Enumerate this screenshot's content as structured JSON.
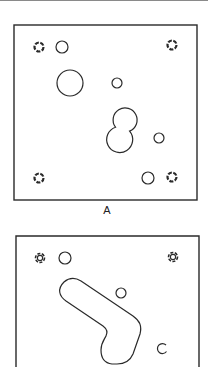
{
  "figure": {
    "stroke_color": "#2a2a2a",
    "background": "#ffffff",
    "panels": [
      {
        "id": "A",
        "label": "A",
        "frame": {
          "x": 14,
          "y": 25,
          "w": 183,
          "h": 175
        },
        "fiducials": [
          {
            "cx": 39,
            "cy": 47
          },
          {
            "cx": 172,
            "cy": 45
          },
          {
            "cx": 39,
            "cy": 178
          },
          {
            "cx": 172,
            "cy": 177
          }
        ],
        "holes": [
          {
            "cx": 62,
            "cy": 47,
            "r": 6
          },
          {
            "cx": 70,
            "cy": 83,
            "r": 13
          },
          {
            "cx": 117,
            "cy": 83,
            "r": 5
          },
          {
            "cx": 159,
            "cy": 138,
            "r": 5
          },
          {
            "cx": 148,
            "cy": 178,
            "r": 6
          }
        ],
        "double_hole": {
          "upper": {
            "cx": 125,
            "cy": 120,
            "r": 12
          },
          "lower": {
            "cx": 112,
            "cy": 139,
            "r": 13
          }
        }
      },
      {
        "id": "B",
        "label": "",
        "frame": {
          "x": 16,
          "y": 236,
          "w": 183,
          "h": 140
        },
        "fiducials": [
          {
            "cx": 40,
            "cy": 258
          },
          {
            "cx": 173,
            "cy": 257
          }
        ],
        "holes": [
          {
            "cx": 65,
            "cy": 258,
            "r": 6
          },
          {
            "cx": 121,
            "cy": 293,
            "r": 5
          }
        ],
        "slot": "boomerang",
        "open_arc": {
          "cx": 162,
          "cy": 348,
          "r": 5
        }
      }
    ]
  }
}
